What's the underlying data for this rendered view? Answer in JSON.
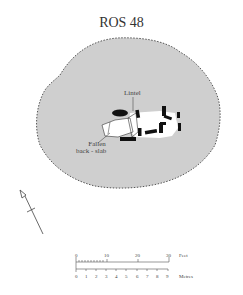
{
  "title": "ROS 48",
  "labels": {
    "lintel": "Lintel",
    "fallen_line1": "Fallen",
    "fallen_line2": "back - slab"
  },
  "scale": {
    "feet_label": "Feet",
    "feet_ticks": [
      "0",
      "10",
      "20",
      "30"
    ],
    "metres_label": "Metres",
    "metres_ticks": [
      "0",
      "1",
      "2",
      "3",
      "4",
      "5",
      "6",
      "7",
      "8",
      "9"
    ]
  },
  "colors": {
    "cairn_fill": "#cfcfcf",
    "stone": "#111111",
    "chamber": "#ffffff"
  }
}
